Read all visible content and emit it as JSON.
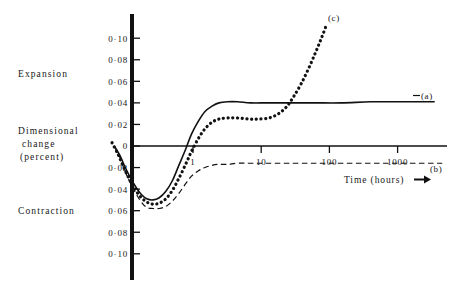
{
  "chart_data": {
    "type": "line",
    "title": "",
    "xlabel": "Time (hours)",
    "ylabel": "Dimensional change (percent)",
    "xscale": "log",
    "xlim": [
      0.06,
      6000
    ],
    "ylim": [
      -0.11,
      0.11
    ],
    "grid": false,
    "legend": "inline-curve-labels",
    "x_ticks": [
      {
        "value": 1,
        "label": "1"
      },
      {
        "value": 10,
        "label": "10"
      },
      {
        "value": 100,
        "label": "100"
      },
      {
        "value": 1000,
        "label": "1000"
      }
    ],
    "y_ticks_expansion": [
      {
        "value": 0.1,
        "label": "0·10"
      },
      {
        "value": 0.08,
        "label": "0·08"
      },
      {
        "value": 0.06,
        "label": "0·06"
      },
      {
        "value": 0.04,
        "label": "0·04"
      },
      {
        "value": 0.02,
        "label": "0·02"
      }
    ],
    "y_tick_zero": {
      "value": 0,
      "label": "0"
    },
    "y_ticks_contraction": [
      {
        "value": -0.02,
        "label": "0·02"
      },
      {
        "value": -0.04,
        "label": "0·04"
      },
      {
        "value": -0.06,
        "label": "0·06"
      },
      {
        "value": -0.08,
        "label": "0·08"
      },
      {
        "value": -0.1,
        "label": "0·10"
      }
    ],
    "region_labels": {
      "expansion": "Expansion",
      "contraction": "Contraction",
      "axis_line1": "Dimensional",
      "axis_line2": "change",
      "axis_line3": "(percent)"
    },
    "series": [
      {
        "name": "a",
        "label": "(a)",
        "style": "solid",
        "color": "#111111",
        "points": [
          [
            0.07,
            0.0
          ],
          [
            0.085,
            -0.009
          ],
          [
            0.1,
            -0.019
          ],
          [
            0.12,
            -0.029
          ],
          [
            0.145,
            -0.038
          ],
          [
            0.175,
            -0.045
          ],
          [
            0.21,
            -0.049
          ],
          [
            0.26,
            -0.05
          ],
          [
            0.32,
            -0.048
          ],
          [
            0.4,
            -0.042
          ],
          [
            0.5,
            -0.032
          ],
          [
            0.62,
            -0.018
          ],
          [
            0.78,
            -0.003
          ],
          [
            0.95,
            0.011
          ],
          [
            1.2,
            0.023
          ],
          [
            1.5,
            0.032
          ],
          [
            1.9,
            0.037
          ],
          [
            2.4,
            0.04
          ],
          [
            3.2,
            0.041
          ],
          [
            4.5,
            0.041
          ],
          [
            7.0,
            0.04
          ],
          [
            12.0,
            0.04
          ],
          [
            25.0,
            0.04
          ],
          [
            60.0,
            0.04
          ],
          [
            150.0,
            0.04
          ],
          [
            400.0,
            0.041
          ],
          [
            1000.0,
            0.041
          ],
          [
            2200.0,
            0.041
          ],
          [
            3500.0,
            0.041
          ]
        ]
      },
      {
        "name": "b",
        "label": "(b)",
        "style": "dashed",
        "color": "#111111",
        "points": [
          [
            0.07,
            0.0
          ],
          [
            0.085,
            -0.011
          ],
          [
            0.1,
            -0.023
          ],
          [
            0.12,
            -0.034
          ],
          [
            0.145,
            -0.044
          ],
          [
            0.175,
            -0.052
          ],
          [
            0.21,
            -0.057
          ],
          [
            0.26,
            -0.058
          ],
          [
            0.32,
            -0.058
          ],
          [
            0.4,
            -0.056
          ],
          [
            0.5,
            -0.051
          ],
          [
            0.62,
            -0.044
          ],
          [
            0.78,
            -0.035
          ],
          [
            0.95,
            -0.028
          ],
          [
            1.2,
            -0.023
          ],
          [
            1.5,
            -0.02
          ],
          [
            1.9,
            -0.018
          ],
          [
            2.4,
            -0.017
          ],
          [
            3.2,
            -0.017
          ],
          [
            4.5,
            -0.016
          ],
          [
            7.0,
            -0.016
          ],
          [
            12.0,
            -0.016
          ],
          [
            25.0,
            -0.016
          ],
          [
            60.0,
            -0.016
          ],
          [
            150.0,
            -0.016
          ],
          [
            400.0,
            -0.016
          ],
          [
            1000.0,
            -0.016
          ],
          [
            2500.0,
            -0.016
          ],
          [
            4500.0,
            -0.016
          ]
        ]
      },
      {
        "name": "c",
        "label": "(c)",
        "style": "dotted",
        "color": "#111111",
        "points": [
          [
            0.065,
            0.003
          ],
          [
            0.08,
            -0.008
          ],
          [
            0.095,
            -0.019
          ],
          [
            0.115,
            -0.03
          ],
          [
            0.14,
            -0.04
          ],
          [
            0.17,
            -0.047
          ],
          [
            0.21,
            -0.052
          ],
          [
            0.26,
            -0.054
          ],
          [
            0.32,
            -0.053
          ],
          [
            0.4,
            -0.049
          ],
          [
            0.5,
            -0.041
          ],
          [
            0.62,
            -0.03
          ],
          [
            0.78,
            -0.017
          ],
          [
            0.95,
            -0.005
          ],
          [
            1.2,
            0.007
          ],
          [
            1.5,
            0.016
          ],
          [
            1.9,
            0.022
          ],
          [
            2.4,
            0.025
          ],
          [
            3.2,
            0.026
          ],
          [
            4.5,
            0.026
          ],
          [
            6.5,
            0.025
          ],
          [
            9.0,
            0.025
          ],
          [
            13.0,
            0.026
          ],
          [
            18.0,
            0.03
          ],
          [
            24.0,
            0.037
          ],
          [
            30.0,
            0.046
          ],
          [
            38.0,
            0.057
          ],
          [
            48.0,
            0.07
          ],
          [
            60.0,
            0.084
          ],
          [
            72.0,
            0.096
          ],
          [
            82.0,
            0.105
          ],
          [
            90.0,
            0.112
          ]
        ]
      }
    ]
  }
}
